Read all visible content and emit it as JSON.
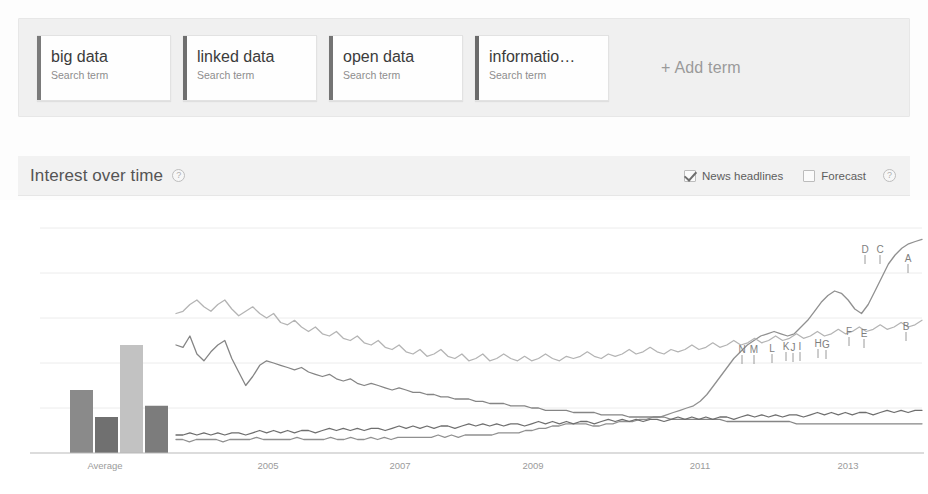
{
  "terms": {
    "cards": [
      {
        "name": "big data",
        "sublabel": "Search term",
        "color": "#7a7a7a"
      },
      {
        "name": "linked data",
        "sublabel": "Search term",
        "color": "#6f6f6f"
      },
      {
        "name": "open data",
        "sublabel": "Search term",
        "color": "#747474"
      },
      {
        "name": "informatio…",
        "sublabel": "Search term",
        "color": "#6b6b6b"
      }
    ],
    "add_label": "+ Add term"
  },
  "section": {
    "title": "Interest over time",
    "help_glyph": "?",
    "news_headlines_label": "News headlines",
    "news_headlines_checked": true,
    "forecast_label": "Forecast",
    "forecast_checked": false,
    "forecast_help_glyph": "?"
  },
  "chart_data": {
    "type": "line",
    "title": "Interest over time",
    "xlabel": "",
    "ylabel": "",
    "grid": true,
    "legend_position": "top",
    "average_label": "Average",
    "x_tick_labels": [
      "2005",
      "2007",
      "2009",
      "2011",
      "2013"
    ],
    "x_tick_positions": [
      268,
      400,
      533,
      700,
      848
    ],
    "ylim": [
      0,
      100
    ],
    "gridline_values": [
      20,
      40,
      60,
      80,
      100
    ],
    "average_bars": {
      "type": "bar",
      "categories": [
        "big data",
        "linked data",
        "open data",
        "informatio…"
      ],
      "values": [
        28,
        16,
        48,
        21
      ],
      "colors": [
        "#8a8a8a",
        "#707070",
        "#c2c2c2",
        "#7c7c7c"
      ]
    },
    "series": [
      {
        "name": "big data",
        "color": "#909090",
        "marker_labels": [
          "N",
          "M",
          "L",
          "K",
          "J",
          "I",
          "H",
          "G",
          "F",
          "E",
          "D",
          "C",
          "B",
          "A"
        ],
        "values": [
          6,
          6,
          5,
          6,
          6,
          6,
          6,
          5,
          6,
          6,
          6,
          6,
          7,
          6,
          6,
          6,
          6,
          6,
          7,
          6,
          6,
          6,
          6,
          7,
          6,
          6,
          7,
          6,
          6,
          7,
          6,
          7,
          6,
          7,
          7,
          7,
          7,
          7,
          7,
          8,
          7,
          8,
          7,
          8,
          8,
          8,
          8,
          8,
          9,
          9,
          9,
          9,
          10,
          10,
          11,
          11,
          12,
          12,
          13,
          13,
          13,
          13,
          12,
          12,
          13,
          13,
          14,
          14,
          14,
          15,
          15,
          16,
          16,
          17,
          18,
          19,
          20,
          21,
          23,
          26,
          30,
          34,
          38,
          42,
          45,
          48,
          50,
          52,
          53,
          54,
          53,
          52,
          53,
          56,
          59,
          63,
          67,
          70,
          72,
          71,
          68,
          64,
          62,
          66,
          72,
          78,
          84,
          88,
          91,
          93,
          94,
          95
        ]
      },
      {
        "name": "linked data",
        "color": "#858585",
        "values": [
          48,
          47,
          52,
          44,
          41,
          45,
          48,
          50,
          42,
          36,
          30,
          34,
          39,
          41,
          40,
          39,
          38,
          37,
          38,
          36,
          35,
          34,
          35,
          33,
          32,
          33,
          31,
          30,
          31,
          30,
          29,
          28,
          29,
          28,
          27,
          27,
          26,
          26,
          25,
          25,
          24,
          24,
          24,
          23,
          23,
          22,
          22,
          22,
          21,
          21,
          21,
          20,
          20,
          19,
          19,
          19,
          19,
          18,
          18,
          18,
          18,
          17,
          17,
          17,
          17,
          16,
          16,
          16,
          16,
          16,
          16,
          15,
          15,
          15,
          15,
          15,
          15,
          15,
          15,
          14,
          14,
          14,
          14,
          14,
          14,
          14,
          14,
          14,
          14,
          13,
          13,
          13,
          13,
          13,
          13,
          13,
          13,
          13,
          13,
          13,
          13,
          13,
          13,
          13,
          13,
          13,
          13,
          13
        ]
      },
      {
        "name": "open data",
        "color": "#b4b4b4",
        "values": [
          62,
          63,
          66,
          68,
          65,
          63,
          66,
          68,
          64,
          61,
          63,
          65,
          62,
          60,
          62,
          58,
          57,
          59,
          56,
          54,
          56,
          53,
          52,
          54,
          51,
          50,
          52,
          49,
          48,
          50,
          47,
          46,
          48,
          45,
          44,
          46,
          43,
          44,
          46,
          43,
          42,
          44,
          41,
          42,
          44,
          41,
          42,
          44,
          42,
          41,
          43,
          41,
          42,
          44,
          42,
          41,
          43,
          42,
          43,
          45,
          43,
          42,
          44,
          43,
          44,
          46,
          44,
          45,
          47,
          45,
          44,
          46,
          45,
          46,
          48,
          46,
          47,
          49,
          47,
          48,
          50,
          48,
          49,
          51,
          49,
          50,
          52,
          50,
          51,
          53,
          51,
          52,
          54,
          52,
          53,
          55,
          53,
          54,
          56,
          54,
          55,
          57,
          55,
          56,
          58,
          56,
          57,
          59
        ]
      },
      {
        "name": "informatio…",
        "color": "#6e6e6e",
        "values": [
          8,
          8,
          9,
          8,
          9,
          8,
          9,
          8,
          9,
          9,
          8,
          9,
          10,
          9,
          10,
          9,
          10,
          9,
          10,
          10,
          9,
          10,
          11,
          10,
          11,
          10,
          11,
          10,
          11,
          11,
          10,
          11,
          12,
          11,
          12,
          11,
          12,
          11,
          12,
          12,
          11,
          12,
          13,
          12,
          13,
          12,
          13,
          12,
          13,
          13,
          12,
          13,
          14,
          13,
          14,
          13,
          14,
          13,
          14,
          14,
          13,
          14,
          15,
          14,
          15,
          14,
          15,
          14,
          15,
          15,
          14,
          15,
          16,
          15,
          16,
          15,
          16,
          15,
          16,
          16,
          15,
          16,
          17,
          16,
          17,
          16,
          17,
          16,
          17,
          17,
          16,
          17,
          18,
          17,
          18,
          17,
          18,
          17,
          18,
          18,
          17,
          18,
          19,
          18,
          19,
          18,
          19,
          19
        ]
      }
    ],
    "news_markers": [
      {
        "label": "N",
        "x": 742,
        "y": 353
      },
      {
        "label": "M",
        "x": 754,
        "y": 353
      },
      {
        "label": "L",
        "x": 772,
        "y": 352
      },
      {
        "label": "K",
        "x": 786,
        "y": 350
      },
      {
        "label": "J",
        "x": 793,
        "y": 351
      },
      {
        "label": "I",
        "x": 800,
        "y": 350
      },
      {
        "label": "H",
        "x": 818,
        "y": 347
      },
      {
        "label": "G",
        "x": 826,
        "y": 348
      },
      {
        "label": "F",
        "x": 849,
        "y": 335
      },
      {
        "label": "E",
        "x": 864,
        "y": 337
      },
      {
        "label": "D",
        "x": 865,
        "y": 253
      },
      {
        "label": "C",
        "x": 880,
        "y": 253
      },
      {
        "label": "B",
        "x": 906,
        "y": 330
      },
      {
        "label": "A",
        "x": 908,
        "y": 262
      }
    ]
  }
}
